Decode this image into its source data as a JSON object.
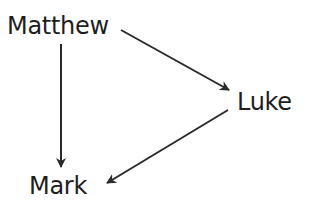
{
  "diagram": {
    "type": "directed-graph",
    "nodes": [
      {
        "id": "matthew",
        "label": "Matthew"
      },
      {
        "id": "luke",
        "label": "Luke"
      },
      {
        "id": "mark",
        "label": "Mark"
      }
    ],
    "edges": [
      {
        "from": "matthew",
        "to": "luke"
      },
      {
        "from": "matthew",
        "to": "mark"
      },
      {
        "from": "luke",
        "to": "mark"
      }
    ],
    "colors": {
      "text": "#1e1e1e",
      "edge": "#2a2a2a",
      "background": "#ffffff"
    }
  }
}
